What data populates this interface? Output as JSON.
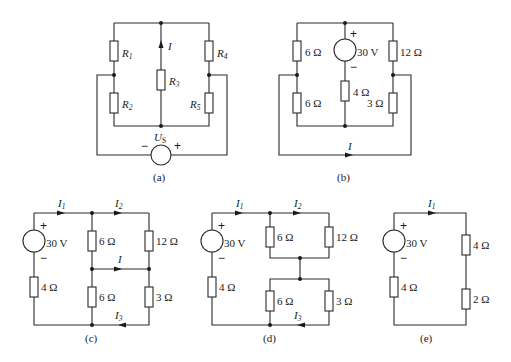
{
  "figure": {
    "panels": [
      {
        "id": "a",
        "caption": "(a)",
        "resistors": [
          {
            "name": "R",
            "sub": "1"
          },
          {
            "name": "R",
            "sub": "2"
          },
          {
            "name": "R",
            "sub": "3"
          },
          {
            "name": "R",
            "sub": "4"
          },
          {
            "name": "R",
            "sub": "5"
          }
        ],
        "source": {
          "name": "U",
          "sub": "S",
          "minus": "−",
          "plus": "+"
        },
        "current": {
          "name": "I"
        }
      },
      {
        "id": "b",
        "caption": "(b)",
        "resistors": [
          "6 Ω",
          "6 Ω",
          "4 Ω",
          "12 Ω",
          "3 Ω"
        ],
        "source": {
          "value": "30 V",
          "plus": "+",
          "minus": "−"
        },
        "current": {
          "name": "I"
        }
      },
      {
        "id": "c",
        "caption": "(c)",
        "resistors": [
          "4 Ω",
          "6 Ω",
          "6 Ω",
          "12 Ω",
          "3 Ω"
        ],
        "source": {
          "value": "30 V",
          "plus": "+",
          "minus": "−"
        },
        "currents": [
          {
            "name": "I",
            "sub": "1"
          },
          {
            "name": "I",
            "sub": "2"
          },
          {
            "name": "I",
            "sub": ""
          },
          {
            "name": "I",
            "sub": "3"
          }
        ]
      },
      {
        "id": "d",
        "caption": "(d)",
        "resistors": [
          "4 Ω",
          "6 Ω",
          "12 Ω",
          "6 Ω",
          "3 Ω"
        ],
        "source": {
          "value": "30 V",
          "plus": "+",
          "minus": "−"
        },
        "currents": [
          {
            "name": "I",
            "sub": "1"
          },
          {
            "name": "I",
            "sub": "2"
          },
          {
            "name": "I",
            "sub": "3"
          }
        ]
      },
      {
        "id": "e",
        "caption": "(e)",
        "resistors": [
          "4 Ω",
          "4 Ω",
          "2 Ω"
        ],
        "source": {
          "value": "30 V",
          "plus": "+",
          "minus": "−"
        },
        "currents": [
          {
            "name": "I",
            "sub": "1"
          }
        ]
      }
    ]
  }
}
